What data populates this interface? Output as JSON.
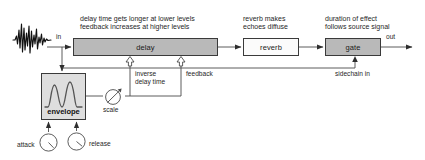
{
  "diagram": {
    "colors": {
      "box_fill_active": "#b9b9b9",
      "box_fill_passive": "#fbfbfb",
      "envelope_fill": "#dedede",
      "stroke": "#3a3a3a",
      "wire": "#555555",
      "text": "#1f1f1f"
    }
  },
  "nodes": {
    "delay": {
      "label": "delay"
    },
    "reverb": {
      "label": "reverb"
    },
    "gate": {
      "label": "gate"
    },
    "envelope": {
      "label": "envelope"
    },
    "scale": {
      "label": "scale"
    }
  },
  "captions": {
    "delay": "delay time gets longer at lower levels\nfeedback increases at higher levels",
    "reverb": "reverb makes\nechoes diffuse",
    "gate": "duration of effect\nfollows source signal"
  },
  "ports": {
    "input": "in",
    "output": "out",
    "inverse_delay_time": "inverse\ndelay time",
    "feedback": "feedback",
    "sidechain_in": "sidechain in"
  },
  "controls": {
    "attack": "attack",
    "release": "release"
  },
  "icons": {
    "source_waveform": "audio-waveform-icon",
    "envelope_curve": "envelope-curve-icon",
    "scale_amplifier": "scale-amplifier-icon",
    "attack_knob": "knob-icon",
    "release_knob": "knob-icon"
  }
}
